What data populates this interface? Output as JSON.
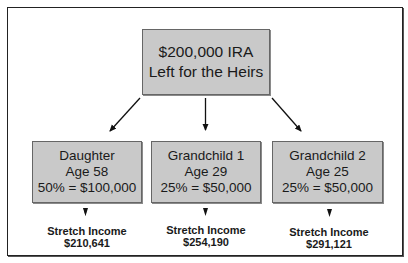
{
  "diagram": {
    "root": {
      "lines": [
        "$200,000 IRA",
        "Left for the Heirs"
      ]
    },
    "heirs": [
      {
        "name": "Daughter",
        "age": "Age 58",
        "share": "50% = $100,000",
        "income_label": "Stretch Income",
        "income_value": "$210,641"
      },
      {
        "name": "Grandchild 1",
        "age": "Age 29",
        "share": "25% = $50,000",
        "income_label": "Stretch Income",
        "income_value": "$254,190"
      },
      {
        "name": "Grandchild 2",
        "age": "Age 25",
        "share": "25% = $50,000",
        "income_label": "Stretch Income",
        "income_value": "$291,121"
      }
    ],
    "colors": {
      "box_fill": "#c9c9c9",
      "box_border": "#666666",
      "frame_border": "#222222",
      "text": "#1a1a1a",
      "arrow": "#111111"
    }
  }
}
